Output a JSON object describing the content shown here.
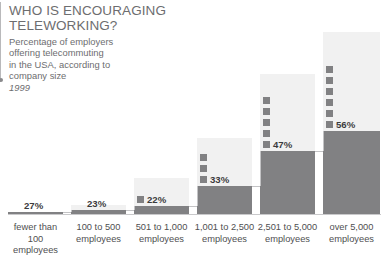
{
  "title": {
    "line1": "WHO IS ENCOURAGING",
    "line2": "TELEWORKING?"
  },
  "subtitle": {
    "line1": "Percentage of employers",
    "line2": "offering telecommuting",
    "line3": "in the USA, according to",
    "line4": "company size",
    "year": "1999"
  },
  "colors": {
    "bar_solid": "#818183",
    "bar_panel": "#f1f1f1",
    "text": "#6d6d6f",
    "value_text": "#3b3b3d",
    "connector": "#c3c3c5",
    "baseline": "#c9c9cb"
  },
  "chart_data": {
    "type": "bar",
    "title": "WHO IS ENCOURAGING TELEWORKING?",
    "subtitle": "Percentage of employers offering telecommuting in the USA, according to company size",
    "annotation": "1999",
    "xlabel": "",
    "ylabel": "",
    "ylim": [
      0,
      60
    ],
    "grid": false,
    "legend": "none",
    "unit": "%",
    "categories": [
      "fewer than 100 employees",
      "100 to 500 employees",
      "501 to 1,000 employees",
      "1,001 to 2,500 employees",
      "2,501 to 5,000 employees",
      "over 5,000 employees"
    ],
    "values": [
      27,
      23,
      22,
      33,
      47,
      56
    ],
    "value_labels": [
      "27%",
      "23%",
      "22%",
      "33%",
      "47%",
      "56%"
    ],
    "marker_squares": [
      0,
      0,
      1,
      3,
      5,
      6
    ]
  },
  "categories_display": [
    {
      "l1": "fewer than",
      "l2": "100 employees"
    },
    {
      "l1": "100 to 500",
      "l2": "employees"
    },
    {
      "l1": "501 to 1,000",
      "l2": "employees"
    },
    {
      "l1": "1,001 to 2,500",
      "l2": "employees"
    },
    {
      "l1": "2,501 to 5,000",
      "l2": "employees"
    },
    {
      "l1": "over 5,000",
      "l2": "employees"
    }
  ]
}
